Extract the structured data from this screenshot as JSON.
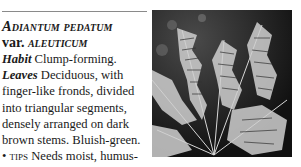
{
  "entry": {
    "name": "Adiantum pedatum",
    "var_prefix": "var.",
    "var_name": "aleuticum",
    "habit_label": "Habit",
    "habit_text": "Clump-forming.",
    "leaves_label": "Leaves",
    "leaves_text": "Deciduous, with finger-like fronds, divided into triangular segments, densely arranged on dark brown stems. Bluish-green.",
    "tips_bullet": "•",
    "tips_label": "tips",
    "tips_text": "Needs moist, humus-rich, alkaline soil."
  },
  "photo": {
    "subject": "fern-fronds-photo",
    "tone": "black-and-white"
  }
}
